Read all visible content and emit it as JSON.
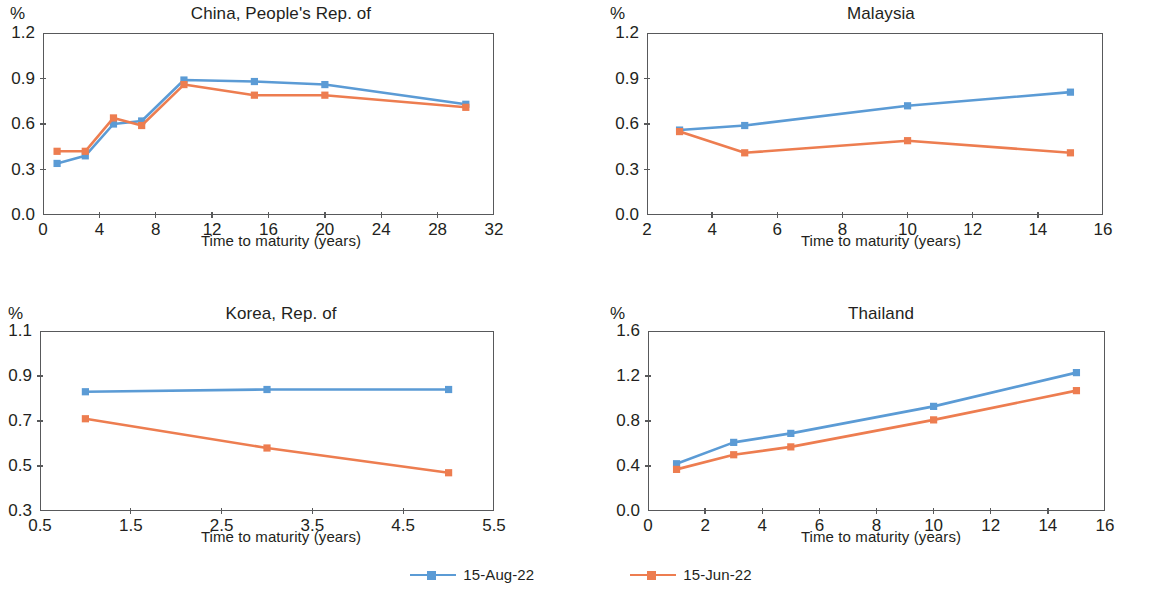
{
  "figure": {
    "unit_label": "%",
    "axis_caption": "Time to maturity (years)"
  },
  "legend": {
    "entries": [
      {
        "label": "15-Aug-22",
        "color": "#5B9BD5",
        "marker": "square"
      },
      {
        "label": "15-Jun-22",
        "color": "#ED7D50",
        "marker": "square"
      }
    ]
  },
  "chart_data": [
    {
      "type": "line",
      "title": "China, People's Rep. of",
      "xlabel": "Time to maturity (years)",
      "ylabel": "%",
      "xlim": [
        0,
        32
      ],
      "ylim": [
        0.0,
        1.2
      ],
      "xticks": [
        0,
        4,
        8,
        12,
        16,
        20,
        24,
        28,
        32
      ],
      "xtick_labels": [
        "0",
        "4",
        "8",
        "12",
        "16",
        "20",
        "24",
        "28",
        "32"
      ],
      "yticks": [
        0.0,
        0.3,
        0.6,
        0.9,
        1.2
      ],
      "ytick_labels": [
        "0.0",
        "0.3",
        "0.6",
        "0.9",
        "1.2"
      ],
      "grid": false,
      "legend_position": "bottom-figure",
      "x": [
        1,
        3,
        5,
        7,
        10,
        15,
        20,
        30
      ],
      "series": [
        {
          "name": "15-Aug-22",
          "color": "#5B9BD5",
          "values": [
            0.34,
            0.39,
            0.6,
            0.62,
            0.89,
            0.88,
            0.86,
            0.73
          ]
        },
        {
          "name": "15-Jun-22",
          "color": "#ED7D50",
          "values": [
            0.42,
            0.42,
            0.64,
            0.59,
            0.86,
            0.79,
            0.79,
            0.71
          ]
        }
      ]
    },
    {
      "type": "line",
      "title": "Malaysia",
      "xlabel": "Time to maturity (years)",
      "ylabel": "%",
      "xlim": [
        2,
        16
      ],
      "ylim": [
        0.0,
        1.2
      ],
      "xticks": [
        2,
        4,
        6,
        8,
        10,
        12,
        14,
        16
      ],
      "xtick_labels": [
        "2",
        "4",
        "6",
        "8",
        "10",
        "12",
        "14",
        "16"
      ],
      "yticks": [
        0.0,
        0.3,
        0.6,
        0.9,
        1.2
      ],
      "ytick_labels": [
        "0.0",
        "0.3",
        "0.6",
        "0.9",
        "1.2"
      ],
      "grid": false,
      "legend_position": "bottom-figure",
      "x": [
        3,
        5,
        10,
        15
      ],
      "series": [
        {
          "name": "15-Aug-22",
          "color": "#5B9BD5",
          "values": [
            0.56,
            0.59,
            0.72,
            0.81
          ]
        },
        {
          "name": "15-Jun-22",
          "color": "#ED7D50",
          "values": [
            0.55,
            0.41,
            0.49,
            0.41
          ]
        }
      ]
    },
    {
      "type": "line",
      "title": "Korea, Rep. of",
      "xlabel": "Time to maturity (years)",
      "ylabel": "%",
      "xlim": [
        0.5,
        5.5
      ],
      "ylim": [
        0.3,
        1.1
      ],
      "xticks": [
        0.5,
        1.5,
        2.5,
        3.5,
        4.5,
        5.5
      ],
      "xtick_labels": [
        "0.5",
        "1.5",
        "2.5",
        "3.5",
        "4.5",
        "5.5"
      ],
      "yticks": [
        0.3,
        0.5,
        0.7,
        0.9,
        1.1
      ],
      "ytick_labels": [
        "0.3",
        "0.5",
        "0.7",
        "0.9",
        "1.1"
      ],
      "grid": false,
      "legend_position": "bottom-figure",
      "x": [
        1,
        3,
        5
      ],
      "series": [
        {
          "name": "15-Aug-22",
          "color": "#5B9BD5",
          "values": [
            0.83,
            0.84,
            0.84
          ]
        },
        {
          "name": "15-Jun-22",
          "color": "#ED7D50",
          "values": [
            0.71,
            0.58,
            0.47
          ]
        }
      ]
    },
    {
      "type": "line",
      "title": "Thailand",
      "xlabel": "Time to maturity (years)",
      "ylabel": "%",
      "xlim": [
        0,
        16
      ],
      "ylim": [
        0.0,
        1.6
      ],
      "xticks": [
        0,
        2,
        4,
        6,
        8,
        10,
        12,
        14,
        16
      ],
      "xtick_labels": [
        "0",
        "2",
        "4",
        "6",
        "8",
        "10",
        "12",
        "14",
        "16"
      ],
      "yticks": [
        0.0,
        0.4,
        0.8,
        1.2,
        1.6
      ],
      "ytick_labels": [
        "0.0",
        "0.4",
        "0.8",
        "1.2",
        "1.6"
      ],
      "grid": false,
      "legend_position": "bottom-figure",
      "x": [
        1,
        3,
        5,
        10,
        15
      ],
      "series": [
        {
          "name": "15-Aug-22",
          "color": "#5B9BD5",
          "values": [
            0.42,
            0.61,
            0.69,
            0.93,
            1.23
          ]
        },
        {
          "name": "15-Jun-22",
          "color": "#ED7D50",
          "values": [
            0.37,
            0.5,
            0.57,
            0.81,
            1.07
          ]
        }
      ]
    }
  ]
}
